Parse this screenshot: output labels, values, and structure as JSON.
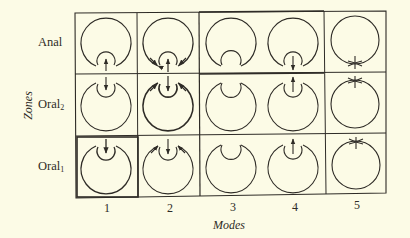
{
  "axes": {
    "y_title": "Zones",
    "x_title": "Modes"
  },
  "zones": [
    {
      "label": "Anal",
      "sub": "",
      "opening": "bottom"
    },
    {
      "label": "Oral",
      "sub": "2",
      "opening": "top"
    },
    {
      "label": "Oral",
      "sub": "1",
      "opening": "top"
    }
  ],
  "modes": [
    "1",
    "2",
    "3",
    "4",
    "5"
  ],
  "cell_glyphs": {
    "1": "arrow-in",
    "2": "arrow-in-with-side-arrows",
    "3": "open-no-arrow",
    "4": "arrow-out",
    "5": "closed-with-cross"
  },
  "colors": {
    "background": "#fcfbe6",
    "ink": "#2e2b26"
  }
}
